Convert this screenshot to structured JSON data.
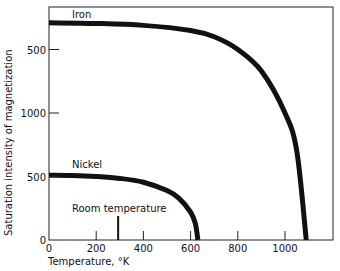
{
  "chart_data": {
    "type": "line",
    "title": "",
    "xlabel": "Temperature, °K",
    "ylabel": "Saturation intensity of magnetization",
    "xlim": [
      0,
      1200
    ],
    "ylim": [
      0,
      1800
    ],
    "x_ticks": [
      0,
      200,
      400,
      600,
      800,
      1000
    ],
    "x_tick_labels": [
      "0",
      "200",
      "400",
      "600",
      "800",
      "1000"
    ],
    "y_ticks": [
      0,
      500,
      1000,
      1500
    ],
    "y_tick_labels": [
      "0",
      "500",
      "1000",
      "500"
    ],
    "grid": false,
    "series": [
      {
        "name": "Iron",
        "x": [
          0,
          200,
          400,
          600,
          700,
          800,
          900,
          1000,
          1050,
          1090
        ],
        "values": [
          1710,
          1705,
          1690,
          1650,
          1600,
          1500,
          1330,
          1000,
          700,
          0
        ]
      },
      {
        "name": "Nickel",
        "x": [
          0,
          100,
          200,
          300,
          400,
          500,
          550,
          600,
          620,
          631
        ],
        "values": [
          510,
          508,
          500,
          485,
          455,
          390,
          330,
          220,
          130,
          0
        ]
      }
    ],
    "annotations": [
      {
        "text": "Room temperature",
        "x": 293,
        "type": "vertical-tick"
      }
    ]
  },
  "labels": {
    "iron": "Iron",
    "nickel": "Nickel",
    "room_temp": "Room temperature",
    "xlabel": "Temperature, °K",
    "ylabel": "Saturation intensity of magnetization"
  }
}
